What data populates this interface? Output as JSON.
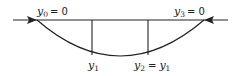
{
  "diagram": {
    "type": "channel-profile",
    "labels": {
      "left_top": {
        "var": "y",
        "sub": "0",
        "rhs": "= 0"
      },
      "right_top": {
        "var": "y",
        "sub": "3",
        "rhs": "= 0"
      },
      "bottom_left": {
        "var": "y",
        "sub": "1"
      },
      "bottom_right": {
        "var": "y",
        "sub": "2",
        "rhs": "=",
        "rhs_var": "y",
        "rhs_sub": "1"
      }
    },
    "colors": {
      "stroke": "#222222",
      "background": "#ffffff"
    }
  }
}
